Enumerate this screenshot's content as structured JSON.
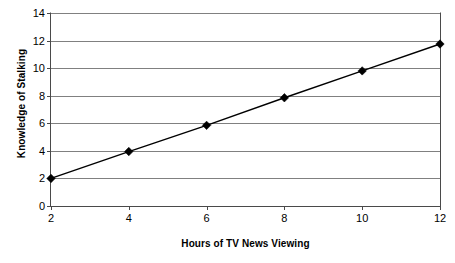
{
  "chart_data": {
    "type": "line",
    "title": "",
    "xlabel": "Hours of TV News Viewing",
    "ylabel": "Knowledge of Stalking",
    "x": [
      2,
      4,
      6,
      8,
      10,
      12
    ],
    "xticklabels": [
      "2",
      "4",
      "6",
      "8",
      "10",
      "12"
    ],
    "yticks": [
      0,
      2,
      4,
      6,
      8,
      10,
      12,
      14
    ],
    "yticklabels": [
      "0",
      "2",
      "4",
      "6",
      "8",
      "10",
      "12",
      "14"
    ],
    "ylim": [
      0,
      14
    ],
    "xlim": [
      2,
      12
    ],
    "grid": "horizontal",
    "legend": "none",
    "marker": "diamond",
    "series": [
      {
        "name": "Knowledge of Stalking",
        "values": [
          2.0,
          3.95,
          5.85,
          7.85,
          9.8,
          11.75
        ],
        "color": "#000000"
      }
    ],
    "colors": {
      "line": "#000000",
      "marker": "#000000",
      "gridline": "#808080",
      "axis": "#4a4a4a",
      "background": "#ffffff"
    }
  }
}
